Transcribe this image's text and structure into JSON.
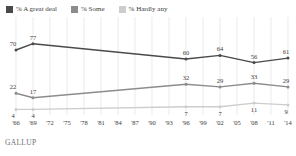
{
  "legend": {
    "items": [
      {
        "label": "% A great deal",
        "color": "#4a4a4a",
        "icon": "square-swatch-icon"
      },
      {
        "label": "% Some",
        "color": "#8c8c8c",
        "icon": "square-swatch-icon"
      },
      {
        "label": "% Hardly any",
        "color": "#cdcdcd",
        "icon": "square-swatch-icon"
      }
    ]
  },
  "footer": {
    "source": "GALLUP"
  },
  "chart_data": {
    "type": "line",
    "title": "",
    "subtitle": "",
    "xlabel": "",
    "ylabel": "",
    "ylim": [
      0,
      100
    ],
    "grid": "vertical",
    "legend_position": "top-left",
    "x": [
      "'66",
      "'69",
      "'72",
      "'75",
      "'78",
      "'81",
      "'84",
      "'87",
      "'90",
      "'93",
      "'96",
      "'99",
      "'02",
      "'05",
      "'08",
      "'11",
      "'14"
    ],
    "tick_labels": [
      "'66",
      "'69",
      "'72",
      "'75",
      "'78",
      "'81",
      "'84",
      "'87",
      "'90",
      "'93",
      "'96",
      "'99",
      "'02",
      "'05",
      "'08",
      "'11",
      "'14"
    ],
    "series": [
      {
        "name": "% A great deal",
        "color": "#4a4a4a",
        "points": [
          {
            "x": "'66",
            "y": 70,
            "label": "70",
            "label_pos": "above"
          },
          {
            "x": "'69",
            "y": 77,
            "label": "77",
            "label_pos": "above"
          },
          {
            "x": "'96",
            "y": 60,
            "label": "60",
            "label_pos": "above"
          },
          {
            "x": "'02",
            "y": 64,
            "label": "64",
            "label_pos": "above"
          },
          {
            "x": "'08",
            "y": 56,
            "label": "56",
            "label_pos": "above"
          },
          {
            "x": "'14",
            "y": 61,
            "label": "61",
            "label_pos": "above"
          }
        ]
      },
      {
        "name": "% Some",
        "color": "#8c8c8c",
        "points": [
          {
            "x": "'66",
            "y": 22,
            "label": "22",
            "label_pos": "above"
          },
          {
            "x": "'69",
            "y": 17,
            "label": "17",
            "label_pos": "above"
          },
          {
            "x": "'96",
            "y": 32,
            "label": "32",
            "label_pos": "above"
          },
          {
            "x": "'02",
            "y": 29,
            "label": "29",
            "label_pos": "above"
          },
          {
            "x": "'08",
            "y": 33,
            "label": "33",
            "label_pos": "above"
          },
          {
            "x": "'14",
            "y": 29,
            "label": "29",
            "label_pos": "above"
          }
        ]
      },
      {
        "name": "% Hardly any",
        "color": "#cdcdcd",
        "points": [
          {
            "x": "'66",
            "y": 4,
            "label": "4",
            "label_pos": "below"
          },
          {
            "x": "'69",
            "y": 4,
            "label": "4",
            "label_pos": "below"
          },
          {
            "x": "'96",
            "y": 7,
            "label": "7",
            "label_pos": "below"
          },
          {
            "x": "'02",
            "y": 7,
            "label": "7",
            "label_pos": "below"
          },
          {
            "x": "'08",
            "y": 11,
            "label": "11",
            "label_pos": "below"
          },
          {
            "x": "'14",
            "y": 9,
            "label": "9",
            "label_pos": "below"
          }
        ]
      }
    ]
  }
}
